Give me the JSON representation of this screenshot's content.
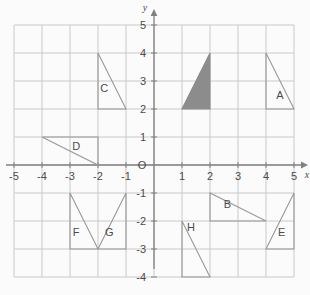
{
  "figure": {
    "axis_names": {
      "x": "x",
      "y": "y"
    },
    "origin_label": "O"
  },
  "chart_data": {
    "type": "scatter",
    "xlabel": "x",
    "ylabel": "y",
    "xlim": [
      -5,
      5
    ],
    "ylim": [
      -4,
      5
    ],
    "grid": true,
    "legend": "none",
    "x_ticks": [
      "-5",
      "-4",
      "-3",
      "-2",
      "-1",
      "O",
      "1",
      "2",
      "3",
      "4",
      "5"
    ],
    "x_tick_values": [
      -5,
      -4,
      -3,
      -2,
      -1,
      0,
      1,
      2,
      3,
      4,
      5
    ],
    "y_ticks": [
      "5",
      "4",
      "3",
      "2",
      "1",
      "O",
      "-1",
      "-2",
      "-3",
      "-4"
    ],
    "y_tick_values": [
      5,
      4,
      3,
      2,
      1,
      0,
      -1,
      -2,
      -3,
      -4
    ],
    "shapes": [
      {
        "id": "shaded",
        "label": "",
        "filled": true,
        "fill_color": "#8c8c8c",
        "stroke_color": "#8c8c8c",
        "points": [
          [
            1,
            2
          ],
          [
            2,
            2
          ],
          [
            2,
            4
          ]
        ],
        "label_pos": [
          0,
          0
        ]
      },
      {
        "id": "A",
        "label": "A",
        "filled": false,
        "fill_color": "none",
        "stroke_color": "#9a9a9a",
        "points": [
          [
            4,
            4
          ],
          [
            4,
            2
          ],
          [
            5,
            2
          ]
        ],
        "label_pos": [
          4.5,
          2.35
        ]
      },
      {
        "id": "B",
        "label": "B",
        "filled": false,
        "fill_color": "none",
        "stroke_color": "#9a9a9a",
        "points": [
          [
            2,
            -1
          ],
          [
            2,
            -2
          ],
          [
            4,
            -2
          ]
        ],
        "label_pos": [
          2.62,
          -1.52
        ]
      },
      {
        "id": "C",
        "label": "C",
        "filled": false,
        "fill_color": "none",
        "stroke_color": "#9a9a9a",
        "points": [
          [
            -2,
            4
          ],
          [
            -2,
            2
          ],
          [
            -1,
            2
          ]
        ],
        "label_pos": [
          -1.78,
          2.62
        ]
      },
      {
        "id": "D",
        "label": "D",
        "filled": false,
        "fill_color": "none",
        "stroke_color": "#9a9a9a",
        "points": [
          [
            -4,
            1
          ],
          [
            -2,
            1
          ],
          [
            -2,
            0
          ]
        ],
        "label_pos": [
          -2.78,
          0.52
        ]
      },
      {
        "id": "E",
        "label": "E",
        "filled": false,
        "fill_color": "none",
        "stroke_color": "#9a9a9a",
        "points": [
          [
            5,
            -1
          ],
          [
            5,
            -3
          ],
          [
            4,
            -3
          ]
        ],
        "label_pos": [
          4.56,
          -2.55
        ]
      },
      {
        "id": "F",
        "label": "F",
        "filled": false,
        "fill_color": "none",
        "stroke_color": "#9a9a9a",
        "points": [
          [
            -3,
            -1
          ],
          [
            -3,
            -3
          ],
          [
            -2,
            -3
          ]
        ],
        "label_pos": [
          -2.78,
          -2.55
        ]
      },
      {
        "id": "G",
        "label": "G",
        "filled": false,
        "fill_color": "none",
        "stroke_color": "#9a9a9a",
        "points": [
          [
            -1,
            -1
          ],
          [
            -1,
            -3
          ],
          [
            -2,
            -3
          ]
        ],
        "label_pos": [
          -1.6,
          -2.55
        ]
      },
      {
        "id": "H",
        "label": "H",
        "filled": false,
        "fill_color": "none",
        "stroke_color": "#9a9a9a",
        "points": [
          [
            1,
            -2
          ],
          [
            1,
            -4
          ],
          [
            2,
            -4
          ]
        ],
        "label_pos": [
          1.32,
          -2.35
        ]
      }
    ],
    "colors": {
      "grid": "#c9c9c9",
      "axis": "#808080",
      "shape_stroke": "#9a9a9a",
      "shaded_fill": "#8c8c8c",
      "text": "#4b4b4b",
      "background": "#fbfbfb"
    }
  }
}
